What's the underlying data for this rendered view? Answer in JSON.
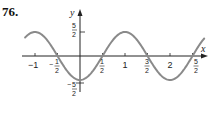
{
  "problem_number": "76.",
  "chart_data": {
    "type": "line",
    "title": "",
    "function": "y = -(5/2) cos(pi x)",
    "xlabel": "x",
    "ylabel": "y",
    "x_ticks": [
      "-1",
      "-1/2",
      "1/2",
      "1",
      "3/2",
      "2",
      "5/2"
    ],
    "y_ticks": [
      "5/2",
      "-5/2"
    ],
    "xlim": [
      -1.25,
      2.8
    ],
    "ylim": [
      -2.5,
      2.5
    ],
    "grid": false,
    "series": [
      {
        "name": "curve",
        "x": [
          -1.2,
          -1,
          -0.5,
          0,
          0.5,
          1,
          1.5,
          2,
          2.5,
          2.75
        ],
        "y": [
          2.02,
          2.5,
          0,
          -2.5,
          0,
          2.5,
          0,
          -2.5,
          0,
          1.77
        ]
      }
    ],
    "curve_color": "#8a8a8a"
  },
  "labels": {
    "x_axis": "x",
    "y_axis": "y",
    "tick_neg1": "−1",
    "tick_1": "1",
    "tick_2": "2",
    "frac_num_5": "5",
    "frac_num_1": "1",
    "frac_num_3": "3",
    "frac_den_2": "2",
    "minus": "−"
  }
}
